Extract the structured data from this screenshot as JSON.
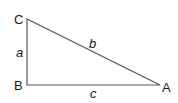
{
  "diagram": {
    "type": "right-triangle",
    "stroke_color": "#555555",
    "vertices": [
      {
        "id": "C",
        "label": "C",
        "x": 27,
        "y": 19
      },
      {
        "id": "B",
        "label": "B",
        "x": 27,
        "y": 85
      },
      {
        "id": "A",
        "label": "A",
        "x": 160,
        "y": 85
      }
    ],
    "sides": [
      {
        "id": "a",
        "label": "a",
        "from": "B",
        "to": "C"
      },
      {
        "id": "b",
        "label": "b",
        "from": "C",
        "to": "A"
      },
      {
        "id": "c",
        "label": "c",
        "from": "B",
        "to": "A"
      }
    ],
    "right_angle_at": "B"
  }
}
